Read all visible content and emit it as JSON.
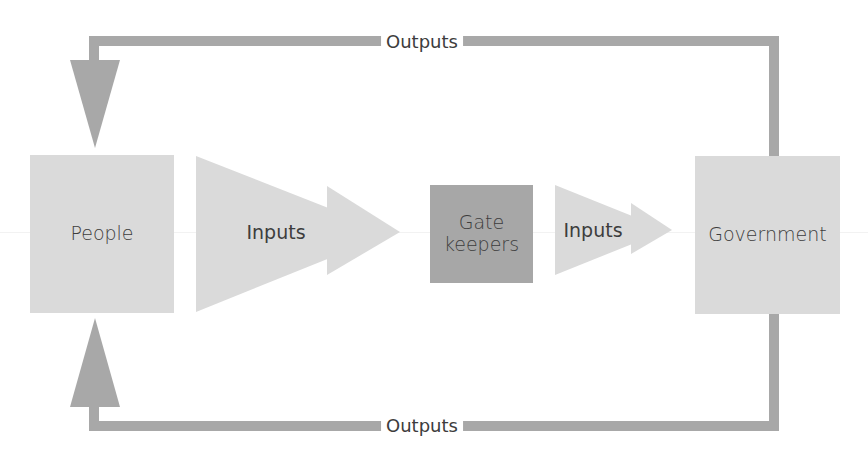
{
  "diagram": {
    "type": "political-system-flow",
    "colors": {
      "box_light": "#dadada",
      "box_dark": "#a7a7a7",
      "connector": "#a8a8a8",
      "text": "#3d3d3d"
    },
    "nodes": {
      "people": {
        "label": "People"
      },
      "gatekeepers": {
        "label_line1": "Gate",
        "label_line2": "keepers"
      },
      "government": {
        "label": "Government"
      }
    },
    "arrows": {
      "inputs_1": {
        "label": "Inputs"
      },
      "inputs_2": {
        "label": "Inputs"
      },
      "outputs_top": {
        "label": "Outputs"
      },
      "outputs_bottom": {
        "label": "Outputs"
      }
    }
  }
}
